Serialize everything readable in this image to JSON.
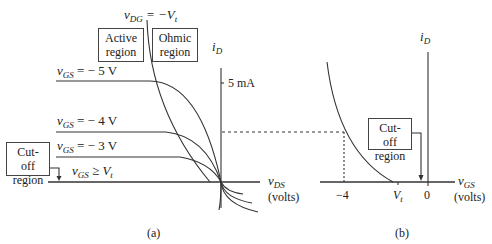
{
  "panel_a": {
    "top_label": {
      "var": "v",
      "sub": "DG",
      "eq": " = −V",
      "eq_sub": "t"
    },
    "active_region": [
      "Active",
      "region"
    ],
    "ohmic_region": [
      "Ohmic",
      "region"
    ],
    "cutoff_region": [
      "Cut-off",
      "region"
    ],
    "y_axis": {
      "var": "i",
      "sub": "D"
    },
    "y_tick": "5 mA",
    "x_axis": {
      "var": "v",
      "sub": "DS",
      "unit": "(volts)"
    },
    "curves": [
      {
        "var": "v",
        "sub": "GS",
        "text": " = − 5 V"
      },
      {
        "var": "v",
        "sub": "GS",
        "text": " = − 4 V"
      },
      {
        "var": "v",
        "sub": "GS",
        "text": " = − 3 V"
      },
      {
        "var": "v",
        "sub": "GS",
        "text": " ≥ V",
        "tail_sub": "t"
      }
    ],
    "caption": "(a)"
  },
  "panel_b": {
    "y_axis": {
      "var": "i",
      "sub": "D"
    },
    "x_axis": {
      "var": "v",
      "sub": "GS",
      "unit": "(volts)"
    },
    "x_ticks": [
      "−4",
      "V",
      "0"
    ],
    "vt_sub": "t",
    "cutoff_region": [
      "Cut-off",
      "region"
    ],
    "caption": "(b)"
  },
  "colors": {
    "line": "#333333",
    "background": "#ffffff"
  }
}
